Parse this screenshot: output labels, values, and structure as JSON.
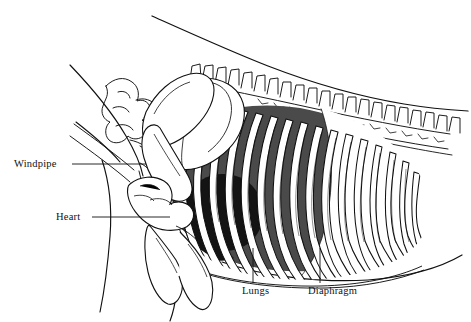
{
  "figure": {
    "background_color": "#ffffff",
    "ink_color": "#111111",
    "lung_fill": "#4a4a4a",
    "heart_fill": "#141414",
    "bone_fill": "#ffffff"
  },
  "labels": {
    "windpipe": "Windpipe",
    "heart": "Heart",
    "lungs": "Lungs",
    "diaphragm": "Diaphragm"
  },
  "parts": {
    "body_outline": "body-outline",
    "spine": "spine-vertebrae",
    "ribcage": "rib-cage",
    "scapula": "scapula-bone",
    "humerus": "humerus-bone",
    "cervical": "cervical-vertebrae",
    "sternum": "sternum-bone",
    "trachea": "trachea"
  }
}
